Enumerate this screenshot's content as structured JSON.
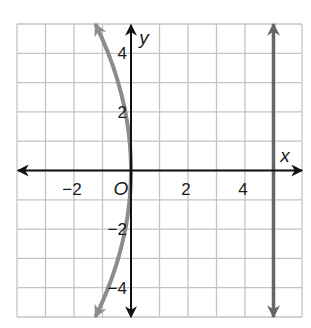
{
  "chart_data": {
    "type": "line",
    "title": "",
    "xlabel": "x",
    "ylabel": "y",
    "xlim": [
      -4,
      6
    ],
    "ylim": [
      -5,
      5
    ],
    "grid": true,
    "grid_step": 1,
    "x_tick_labels": [
      {
        "value": -2,
        "label": "−2"
      },
      {
        "value": 2,
        "label": "2"
      },
      {
        "value": 4,
        "label": "4"
      }
    ],
    "y_tick_labels": [
      {
        "value": 4,
        "label": "4"
      },
      {
        "value": 2,
        "label": "2"
      },
      {
        "value": -2,
        "label": "−2"
      },
      {
        "value": -4,
        "label": "−4"
      }
    ],
    "origin_label": "O",
    "series": [
      {
        "name": "parabola",
        "description": "parabola opening left with vertex at origin, x = -y^2/20",
        "color": "#8c8c8c",
        "points": [
          {
            "x": -1.25,
            "y": 5
          },
          {
            "x": -0.8,
            "y": 4
          },
          {
            "x": -0.45,
            "y": 3
          },
          {
            "x": -0.2,
            "y": 2
          },
          {
            "x": -0.05,
            "y": 1
          },
          {
            "x": 0,
            "y": 0
          },
          {
            "x": -0.05,
            "y": -1
          },
          {
            "x": -0.2,
            "y": -2
          },
          {
            "x": -0.45,
            "y": -3
          },
          {
            "x": -0.8,
            "y": -4
          },
          {
            "x": -1.25,
            "y": -5
          }
        ]
      },
      {
        "name": "directrix",
        "description": "vertical line x = 5",
        "color": "#666666",
        "points": [
          {
            "x": 5,
            "y": -5
          },
          {
            "x": 5,
            "y": 5
          }
        ]
      }
    ]
  },
  "colors": {
    "grid": "#c4c4c4",
    "axis": "#111111",
    "parabola": "#8c8c8c",
    "line": "#666666"
  }
}
